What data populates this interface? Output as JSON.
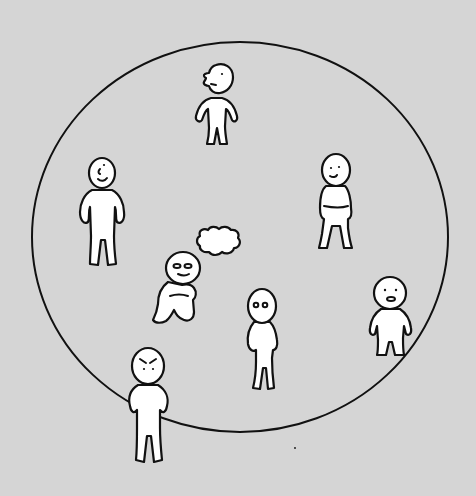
{
  "illustration": {
    "description": "Hand-drawn line illustration: a large circle containing several small white figures; two figures straddle the circle boundary",
    "colors": {
      "background": "#d5d5d5",
      "figure_fill": "#ffffff",
      "stroke": "#111111"
    },
    "circle": {
      "cx": 240,
      "cy": 237,
      "rx": 208,
      "ry": 195
    },
    "figures": [
      {
        "id": "top-profile-figure",
        "pose": "hands on hips, facing left in profile",
        "position": "inside, top"
      },
      {
        "id": "left-smiling-figure",
        "pose": "standing, hands on hips, smiling",
        "position": "inside, left"
      },
      {
        "id": "right-standing-figure",
        "pose": "standing, hands in pockets",
        "position": "inside, right"
      },
      {
        "id": "sitting-figure",
        "pose": "sitting hugging knees, thinking",
        "position": "inside, center-left"
      },
      {
        "id": "thought-cloud",
        "pose": "cloud",
        "position": "inside, center"
      },
      {
        "id": "center-surprised-figure",
        "pose": "standing, wide eyes",
        "position": "inside, center"
      },
      {
        "id": "edge-right-figure",
        "pose": "standing on circle edge, mouth open",
        "position": "on boundary, right"
      },
      {
        "id": "edge-bottom-angry-figure",
        "pose": "hands on hips, angry brows",
        "position": "on boundary, bottom-left"
      }
    ]
  }
}
